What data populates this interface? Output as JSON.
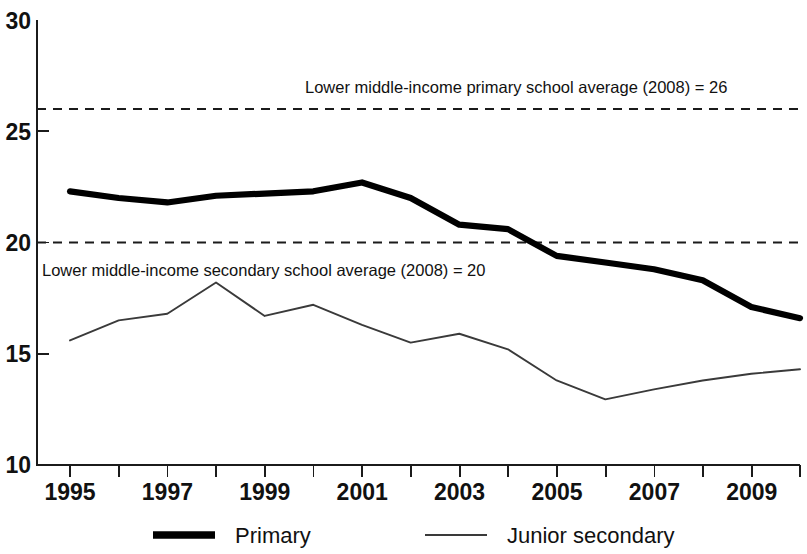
{
  "chart_data": {
    "type": "line",
    "title": "",
    "subtitle": "",
    "xlabel": "",
    "ylabel": "",
    "xlim": [
      1995,
      2010
    ],
    "ylim": [
      10,
      30
    ],
    "grid": false,
    "legend_position": "bottom",
    "x": [
      1995,
      1996,
      1997,
      1998,
      1999,
      2000,
      2001,
      2002,
      2003,
      2004,
      2005,
      2006,
      2007,
      2008,
      2009,
      2010
    ],
    "y_ticks": [
      10,
      15,
      20,
      25,
      30
    ],
    "y_tick_labels": [
      "10",
      "15",
      "20",
      "25",
      "30"
    ],
    "x_ticks": [
      1995,
      1996,
      1997,
      1998,
      1999,
      2000,
      2001,
      2002,
      2003,
      2004,
      2005,
      2006,
      2007,
      2008,
      2009,
      2010
    ],
    "x_tick_labels": [
      "1995",
      "",
      "1997",
      "",
      "1999",
      "",
      "2001",
      "",
      "2003",
      "",
      "2005",
      "",
      "2007",
      "",
      "2009",
      ""
    ],
    "series": [
      {
        "name": "Primary",
        "style": "thick-solid",
        "color": "#000000",
        "values": [
          22.3,
          22.0,
          21.8,
          22.1,
          22.2,
          22.3,
          22.7,
          22.0,
          20.8,
          20.6,
          19.4,
          19.1,
          18.8,
          18.3,
          17.1,
          16.6
        ]
      },
      {
        "name": "Junior secondary",
        "style": "thin-solid",
        "color": "#3a3a3a",
        "values": [
          15.6,
          16.5,
          16.8,
          18.2,
          16.7,
          17.2,
          16.3,
          15.5,
          15.9,
          15.2,
          13.8,
          12.95,
          13.4,
          13.8,
          14.1,
          14.3
        ]
      }
    ],
    "reference_lines": [
      {
        "id": "primary-average",
        "value": 26,
        "label": "Lower middle-income primary school average (2008) = 26",
        "label_position": "above"
      },
      {
        "id": "secondary-average",
        "value": 20,
        "label": "Lower middle-income secondary school average (2008) = 20",
        "label_position": "below"
      }
    ],
    "legend": [
      {
        "label": "Primary",
        "style": "thick-solid"
      },
      {
        "label": "Junior secondary",
        "style": "thin-solid"
      }
    ]
  },
  "axes": {
    "y_labels": [
      "30",
      "25",
      "20",
      "15",
      "10"
    ],
    "x_labels": [
      "1995",
      "1997",
      "1999",
      "2001",
      "2003",
      "2005",
      "2007",
      "2009"
    ]
  },
  "annotations": {
    "primary_average": "Lower middle-income primary school average (2008) = 26",
    "secondary_average": "Lower middle-income secondary school average (2008) = 20"
  },
  "legend": {
    "primary": "Primary",
    "junior_secondary": "Junior secondary"
  }
}
